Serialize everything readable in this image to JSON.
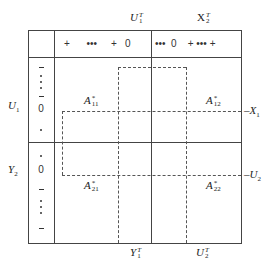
{
  "top_labels": {
    "u1t": {
      "base": "U",
      "sup": "T",
      "sub": "1"
    },
    "x2t": {
      "base": "X",
      "sup": "T",
      "sub": "2"
    }
  },
  "bottom_labels": {
    "y1t": {
      "base": "Y",
      "sup": "T",
      "sub": "1"
    },
    "u2t": {
      "base": "U",
      "sup": "T",
      "sub": "2"
    }
  },
  "left_labels": {
    "u1": {
      "base": "U",
      "sub": "1"
    },
    "y2": {
      "base": "Y",
      "sub": "2"
    }
  },
  "right_labels": {
    "x1": {
      "base": "–X",
      "sub": "1"
    },
    "u2": {
      "base": "–U",
      "sub": "2"
    }
  },
  "header_row": {
    "left_part": "+      •••     +   0",
    "right_part": "•••  0    + ••• +"
  },
  "header_column": {
    "upper": [
      "-",
      "•",
      "•",
      "•",
      "-",
      "0",
      "•"
    ],
    "lower": [
      "•",
      "0",
      "-",
      "•",
      "•",
      "•",
      "-"
    ]
  },
  "blocks": {
    "a11": {
      "base": "A",
      "sup": "*",
      "sub": "11"
    },
    "a12": {
      "base": "A",
      "sup": "*",
      "sub": "12"
    },
    "a21": {
      "base": "A",
      "sup": "*",
      "sub": "21"
    },
    "a22": {
      "base": "A",
      "sup": "*",
      "sub": "22"
    }
  }
}
